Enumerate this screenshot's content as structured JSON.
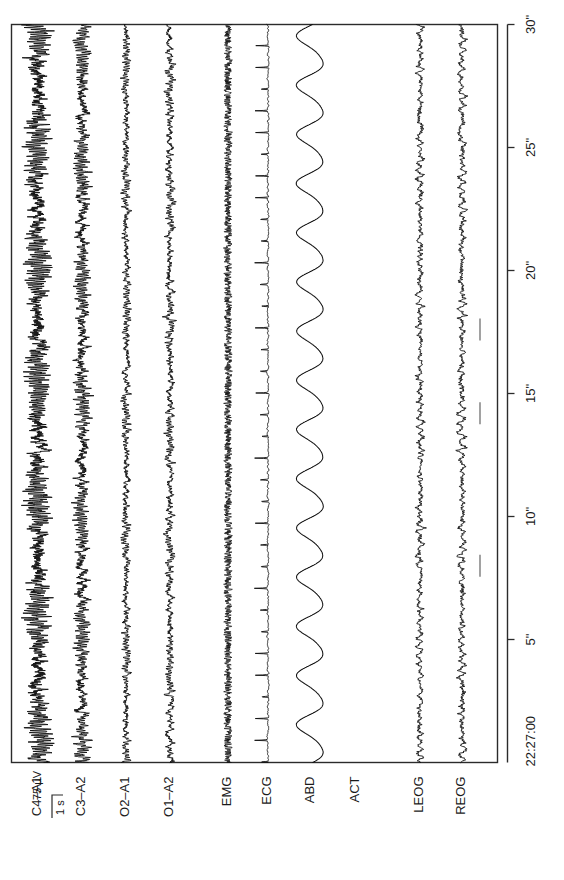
{
  "figure": {
    "kind": "polysomnogram-epoch",
    "orientation": "rotated-90-ccw",
    "background_color": "#ffffff",
    "trace_color": "#111111",
    "border_color": "#2b2b2b"
  },
  "chart_data": {
    "type": "line",
    "title": "",
    "subtitle": "",
    "xlabel": "",
    "ylabel": "",
    "legend_position": "none",
    "grid": false,
    "epoch_start_time": "22:27:00",
    "epoch_duration_seconds": 30,
    "x": [
      0,
      30
    ],
    "xlim": [
      0,
      30
    ],
    "tick_labels": [
      "5\"",
      "10\"",
      "15\"",
      "20\"",
      "25\"",
      "30\""
    ],
    "tick_values": [
      5,
      10,
      15,
      20,
      25,
      30
    ],
    "calibration": {
      "amplitude_label": "75 µV",
      "time_label": "1 s",
      "amplitude_value": 75,
      "amplitude_units": "µV",
      "time_value": 1,
      "time_units": "s"
    },
    "series": [
      {
        "name": "C4-A1",
        "label": "C4–A1",
        "signal_type": "eeg",
        "amplitude": 15.5,
        "noise": 5.0,
        "base_freq": 10.5,
        "detail_freq": 26,
        "smooth": 0,
        "spikes": false,
        "visible": true
      },
      {
        "name": "C3-A2",
        "label": "C3–A2",
        "signal_type": "eeg",
        "amplitude": 9.0,
        "noise": 3.6,
        "base_freq": 10.0,
        "detail_freq": 24,
        "smooth": 0,
        "spikes": false,
        "visible": true
      },
      {
        "name": "O2-A1",
        "label": "O2–A1",
        "signal_type": "eeg",
        "amplitude": 4.2,
        "noise": 2.3,
        "base_freq": 9.0,
        "detail_freq": 22,
        "smooth": 0,
        "spikes": false,
        "visible": true
      },
      {
        "name": "O1-A2",
        "label": "O1–A2",
        "signal_type": "eeg",
        "amplitude": 4.0,
        "noise": 2.4,
        "base_freq": 9.5,
        "detail_freq": 23,
        "smooth": 0,
        "spikes": false,
        "visible": true
      },
      {
        "name": "EMG",
        "label": "EMG",
        "signal_type": "emg",
        "amplitude": 1.4,
        "noise": 4.6,
        "base_freq": 60,
        "detail_freq": 150,
        "smooth": 0,
        "spikes": false,
        "visible": true
      },
      {
        "name": "ECG",
        "label": "ECG",
        "signal_type": "ecg",
        "amplitude": 1.2,
        "noise": 1.0,
        "base_freq": 0,
        "detail_freq": 0,
        "smooth": 0,
        "spikes": true,
        "heart_rate_bpm": 68,
        "qrs_amplitude": 9.0,
        "visible": true
      },
      {
        "name": "ABD",
        "label": "ABD",
        "signal_type": "respiration",
        "amplitude": 13.0,
        "noise": 0.35,
        "base_freq": 0.5,
        "detail_freq": 1.0,
        "smooth": 1,
        "spikes": false,
        "respiration_rate_per_min": 30,
        "visible": true
      },
      {
        "name": "ACT",
        "label": "ACT",
        "signal_type": "activity",
        "amplitude": 0,
        "noise": 0,
        "base_freq": 0,
        "detail_freq": 0,
        "smooth": 0,
        "spikes": false,
        "visible": false
      },
      {
        "name": "LEOG",
        "label": "LEOG",
        "signal_type": "eog",
        "amplitude": 4.0,
        "noise": 2.0,
        "base_freq": 3.0,
        "detail_freq": 14,
        "smooth": 0,
        "spikes": false,
        "visible": true
      },
      {
        "name": "REOG",
        "label": "REOG",
        "signal_type": "eog",
        "amplitude": 4.4,
        "noise": 2.2,
        "base_freq": 2.6,
        "detail_freq": 13,
        "smooth": 0,
        "spikes": false,
        "visible": true
      }
    ],
    "event_marks": [
      {
        "channel": "REOG",
        "time_seconds": 8.0
      },
      {
        "channel": "REOG",
        "time_seconds": 14.2
      },
      {
        "channel": "REOG",
        "time_seconds": 17.6
      }
    ],
    "annotations": []
  }
}
